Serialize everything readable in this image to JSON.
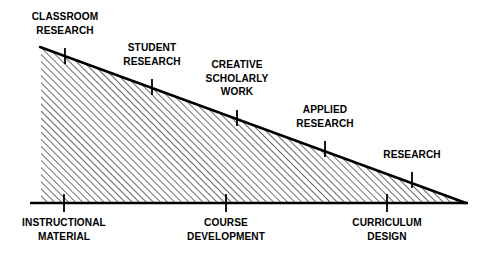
{
  "figure": {
    "type": "triangle-continuum-diagram",
    "title": "",
    "background_color": "#ffffff",
    "stroke_color": "#000000",
    "fill_pattern": "diagonal-hatch",
    "hatch_direction": "forward-slash",
    "hatch_spacing_px": 5,
    "geometry": {
      "top_left_x": 41,
      "top_left_y": 48,
      "bottom_left_x": 41,
      "bottom_left_y": 203,
      "apex_x": 465,
      "apex_y": 203,
      "baseline_start_x": 30,
      "baseline_end_x": 468,
      "baseline_y": 203
    },
    "upper_labels": [
      {
        "id": "classroom-research",
        "lines": [
          "CLASSROOM",
          "RESEARCH"
        ],
        "tick_x": 65,
        "tick_top_y": 48,
        "tick_bottom_y": 64,
        "label_center_x": 65,
        "label_top_y": 10
      },
      {
        "id": "student-research",
        "lines": [
          "STUDENT",
          "RESEARCH"
        ],
        "tick_x": 152,
        "tick_top_y": 79,
        "tick_bottom_y": 95,
        "label_center_x": 152,
        "label_top_y": 41
      },
      {
        "id": "creative-scholarly-work",
        "lines": [
          "CREATIVE",
          "SCHOLARLY",
          "WORK"
        ],
        "tick_x": 237,
        "tick_top_y": 110,
        "tick_bottom_y": 126,
        "label_center_x": 237,
        "label_top_y": 58
      },
      {
        "id": "applied-research",
        "tick_x": 325,
        "lines": [
          "APPLIED",
          "RESEARCH"
        ],
        "tick_top_y": 141,
        "tick_bottom_y": 157,
        "label_center_x": 325,
        "label_top_y": 103
      },
      {
        "id": "research",
        "lines": [
          "RESEARCH"
        ],
        "tick_x": 412,
        "tick_top_y": 172,
        "tick_bottom_y": 188,
        "label_center_x": 412,
        "label_top_y": 148
      }
    ],
    "lower_labels": [
      {
        "id": "instructional-material",
        "lines": [
          "INSTRUCTIONAL",
          "MATERIAL"
        ],
        "tick_x": 64,
        "tick_top_y": 195,
        "tick_bottom_y": 211,
        "label_center_x": 64,
        "label_top_y": 216
      },
      {
        "id": "course-development",
        "lines": [
          "COURSE",
          "DEVELOPMENT"
        ],
        "tick_x": 226,
        "tick_top_y": 195,
        "tick_bottom_y": 211,
        "label_center_x": 226,
        "label_top_y": 216
      },
      {
        "id": "curriculum-design",
        "lines": [
          "CURRICULUM",
          "DESIGN"
        ],
        "tick_x": 387,
        "tick_top_y": 195,
        "tick_bottom_y": 211,
        "label_center_x": 387,
        "label_top_y": 216
      }
    ]
  }
}
